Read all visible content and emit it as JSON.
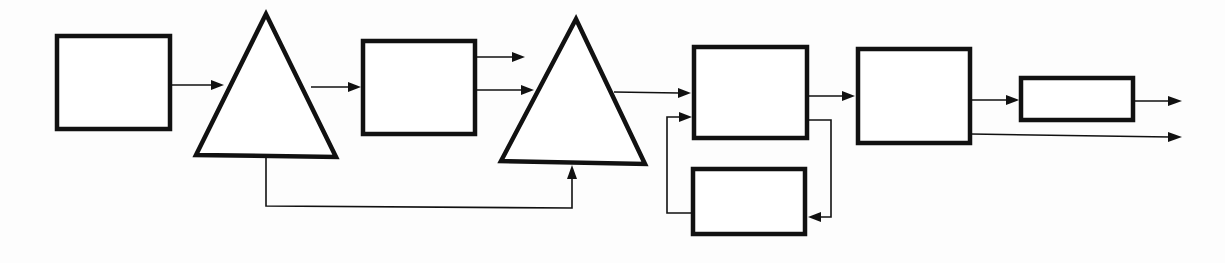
{
  "diagram": {
    "type": "block-diagram",
    "labels": [],
    "colors": {
      "stroke": "#111111",
      "background": "#fdfdfd",
      "fill": "#ffffff"
    },
    "nodes": [
      {
        "id": "box-1",
        "shape": "rectangle",
        "x": 57,
        "y": 36,
        "w": 113,
        "h": 93
      },
      {
        "id": "triangle-1",
        "shape": "triangle",
        "points": "266,13 196,155 336,157"
      },
      {
        "id": "box-2",
        "shape": "rectangle",
        "x": 363,
        "y": 41,
        "w": 112,
        "h": 93
      },
      {
        "id": "triangle-2",
        "shape": "triangle",
        "points": "576,18 501,161 645,164"
      },
      {
        "id": "box-3",
        "shape": "rectangle",
        "x": 694,
        "y": 47,
        "w": 113,
        "h": 91
      },
      {
        "id": "box-4",
        "shape": "rectangle",
        "x": 693,
        "y": 169,
        "w": 112,
        "h": 65
      },
      {
        "id": "box-5",
        "shape": "rectangle",
        "x": 858,
        "y": 49,
        "w": 112,
        "h": 94
      },
      {
        "id": "box-6",
        "shape": "rectangle",
        "x": 1021,
        "y": 78,
        "w": 112,
        "h": 42
      }
    ],
    "edges": [
      {
        "id": "box1-to-tri1",
        "path": "M171,85 L213,85",
        "arrow": "213,85"
      },
      {
        "id": "tri1-to-box2",
        "path": "M311,87 L350,87",
        "arrow": "350,87"
      },
      {
        "id": "box2-output-top",
        "path": "M476,57 L515,57",
        "arrow": "515,57"
      },
      {
        "id": "box2-to-tri2",
        "path": "M476,90 L524,90",
        "arrow": "524,90"
      },
      {
        "id": "tri1-feedforward-to-tri2",
        "path": "M266,157 L266,206 L572,208 L572,178",
        "arrow-up": "572,166"
      },
      {
        "id": "tri2-to-box3",
        "path": "M615,92 L680,93",
        "arrow": "680,93"
      },
      {
        "id": "box3-to-box4-loop",
        "path": "M808,120 L831,120 L831,217 L818,217",
        "arrow-left": "808,217"
      },
      {
        "id": "box4-to-box3-loop",
        "path": "M692,213 L667,213 L667,117 L680,117",
        "arrow": "692,117"
      },
      {
        "id": "box3-to-box5",
        "path": "M808,96 L844,96",
        "arrow": "844,96"
      },
      {
        "id": "box5-to-box6",
        "path": "M971,100 L1008,100",
        "arrow": "1008,100"
      },
      {
        "id": "box6-output",
        "path": "M1134,101 L1170,101",
        "arrow": "1181,101"
      },
      {
        "id": "box5-output-bottom",
        "path": "M971,134 L1170,137",
        "arrow": "1181,137"
      }
    ]
  }
}
